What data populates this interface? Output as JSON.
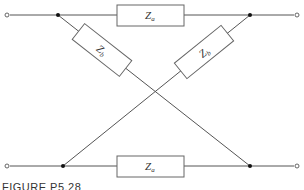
{
  "figure": {
    "caption": "FIGURE P5.28",
    "type": "lattice network (two-port)"
  },
  "components": {
    "top_series": {
      "symbol": "Z",
      "subscript": "a"
    },
    "bottom_series": {
      "symbol": "Z",
      "subscript": "a"
    },
    "diagonal_left": {
      "symbol": "Z",
      "subscript": "b"
    },
    "diagonal_right": {
      "symbol": "Z",
      "subscript": "b"
    }
  },
  "colors": {
    "wire": "#555555",
    "node": "#111111",
    "text": "#333333"
  }
}
